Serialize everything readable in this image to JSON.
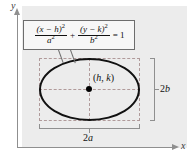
{
  "figure": {
    "background_color": "#ececec",
    "page_color": "#ffffff"
  },
  "axes": {
    "y_label": "y",
    "x_label": "x",
    "color": "#8f8f8f",
    "y_arrow": "arrow-up",
    "x_arrow": "arrow-right"
  },
  "formula": {
    "first_term": {
      "numerator": "(x − h)",
      "numerator_exponent": "2",
      "denominator": "a",
      "denominator_exponent": "2"
    },
    "operator": "+",
    "second_term": {
      "numerator": "(y − k)",
      "numerator_exponent": "2",
      "denominator": "b",
      "denominator_exponent": "2"
    },
    "equals": "=",
    "right_side": "1",
    "plain_text": "(x - h)^2/a^2 + (y - k)^2/b^2 = 1",
    "box_border_color": "#6d6d6d",
    "box_fill_color": "#f7f7f7"
  },
  "ellipse": {
    "center_label": "(h, k)",
    "center_h": "h",
    "center_k": "k",
    "stroke_color": "#111111",
    "guide_color": "#b09a9a"
  },
  "dimensions": {
    "width_label": "2a",
    "width_label_number": "2",
    "width_label_var": "a",
    "height_label": "2b",
    "height_label_number": "2",
    "height_label_var": "b",
    "bracket_color": "#8f8f8f"
  }
}
